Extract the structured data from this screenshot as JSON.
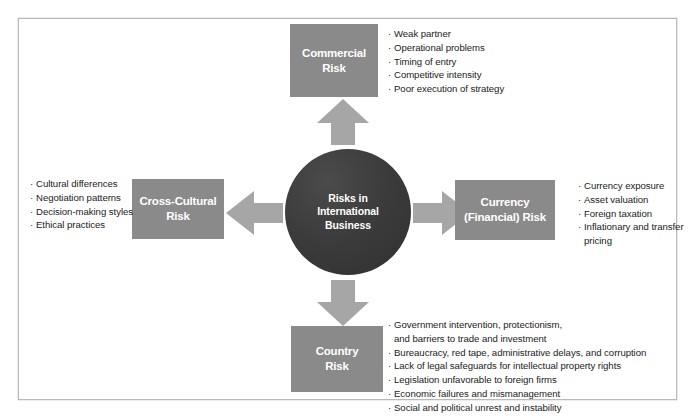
{
  "diagram": {
    "center": {
      "label": "Risks in\nInternational\nBusiness"
    },
    "nodes": [
      {
        "id": "commercial",
        "label": "Commercial\nRisk",
        "bullets": [
          "Weak partner",
          "Operational problems",
          "Timing of entry",
          "Competitive intensity",
          "Poor execution of strategy"
        ]
      },
      {
        "id": "cross-cultural",
        "label": "Cross-Cultural\nRisk",
        "bullets": [
          "Cultural differences",
          "Negotiation patterns",
          "Decision-making styles",
          "Ethical practices"
        ]
      },
      {
        "id": "currency",
        "label": "Currency\n(Financial) Risk",
        "bullets": [
          "Currency exposure",
          "Asset valuation",
          "Foreign taxation",
          "Inflationary and transfer pricing"
        ]
      },
      {
        "id": "country",
        "label": "Country\nRisk",
        "bullets": [
          "Government intervention, protectionism,\n  and barriers to trade and investment",
          "Bureaucracy, red tape, administrative delays, and corruption",
          "Lack of legal safeguards for intellectual property rights",
          "Legislation unfavorable to foreign firms",
          "Economic failures and mismanagement",
          "Social and political unrest and instability"
        ]
      }
    ],
    "bullet_glyph": "·",
    "colors": {
      "box_fill": "#8a8a8a",
      "circle_fill": "#3c3c3c",
      "arrow_fill": "#a6a6a6",
      "text_on_fill": "#ffffff",
      "body_text": "#1b1b1b",
      "frame_border": "#b9b9b9",
      "background": "#ffffff"
    }
  }
}
